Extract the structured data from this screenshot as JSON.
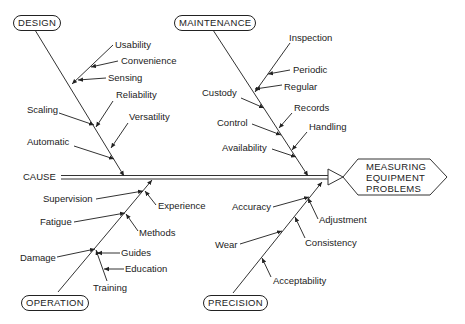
{
  "diagram": {
    "type": "fishbone",
    "effect": [
      "MEASURING",
      "EQUIPMENT",
      "PROBLEMS"
    ],
    "spine_label": "CAUSE",
    "categories": {
      "design": {
        "label": "DESIGN",
        "causes": [
          "Usability",
          "Convenience",
          "Sensing",
          "Reliability",
          "Scaling",
          "Versatility",
          "Automatic"
        ]
      },
      "maintenance": {
        "label": "MAINTENANCE",
        "causes": [
          "Inspection",
          "Periodic",
          "Regular",
          "Custody",
          "Records",
          "Control",
          "Handling",
          "Availability"
        ]
      },
      "operation": {
        "label": "OPERATION",
        "causes": [
          "Supervision",
          "Experience",
          "Fatigue",
          "Methods",
          "Damage",
          "Guides",
          "Education",
          "Training"
        ]
      },
      "precision": {
        "label": "PRECISION",
        "causes": [
          "Accuracy",
          "Adjustment",
          "Wear",
          "Consistency",
          "Acceptability"
        ]
      }
    }
  }
}
